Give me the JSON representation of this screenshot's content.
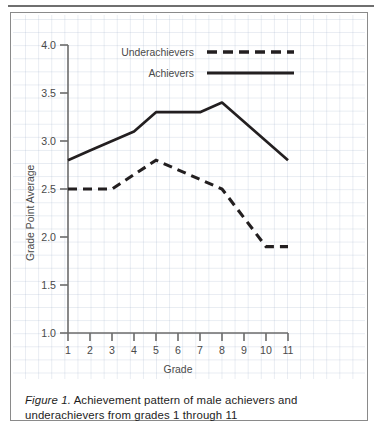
{
  "figure": {
    "caption_prefix": "Figure 1.",
    "caption_text": " Achievement pattern of male achievers and underachievers from grades 1 through 11"
  },
  "chart_data": {
    "type": "line",
    "title": "",
    "xlabel": "Grade",
    "ylabel": "Grade Point Average",
    "x": [
      1,
      2,
      3,
      4,
      5,
      6,
      7,
      8,
      9,
      10,
      11
    ],
    "categories": [
      "1",
      "2",
      "3",
      "4",
      "5",
      "6",
      "7",
      "8",
      "9",
      "10",
      "11"
    ],
    "xlim": [
      1,
      11
    ],
    "ylim": [
      1.0,
      4.0
    ],
    "ytick_labels": [
      "1.0",
      "1.5",
      "2.0",
      "2.5",
      "3.0",
      "3.5",
      "4.0"
    ],
    "ytick_values": [
      1.0,
      1.5,
      2.0,
      2.5,
      3.0,
      3.5,
      4.0
    ],
    "grid": "graph-paper background grid",
    "legend_position": "upper-center",
    "series": [
      {
        "name": "Underachievers",
        "style": "dashed",
        "color": "#231f20",
        "values": [
          2.5,
          2.5,
          2.5,
          2.65,
          2.8,
          2.7,
          2.6,
          2.5,
          2.2,
          1.9,
          1.9
        ]
      },
      {
        "name": "Achievers",
        "style": "solid",
        "color": "#231f20",
        "values": [
          2.8,
          2.9,
          3.0,
          3.1,
          3.3,
          3.3,
          3.3,
          3.4,
          3.2,
          3.0,
          2.8
        ]
      }
    ]
  },
  "colors": {
    "line": "#231f20",
    "axis": "#6b6b6b",
    "grid": "#8ca0be",
    "border": "#8a8a8a",
    "text": "#4a4a4a",
    "caption": "#1d1d1d"
  }
}
